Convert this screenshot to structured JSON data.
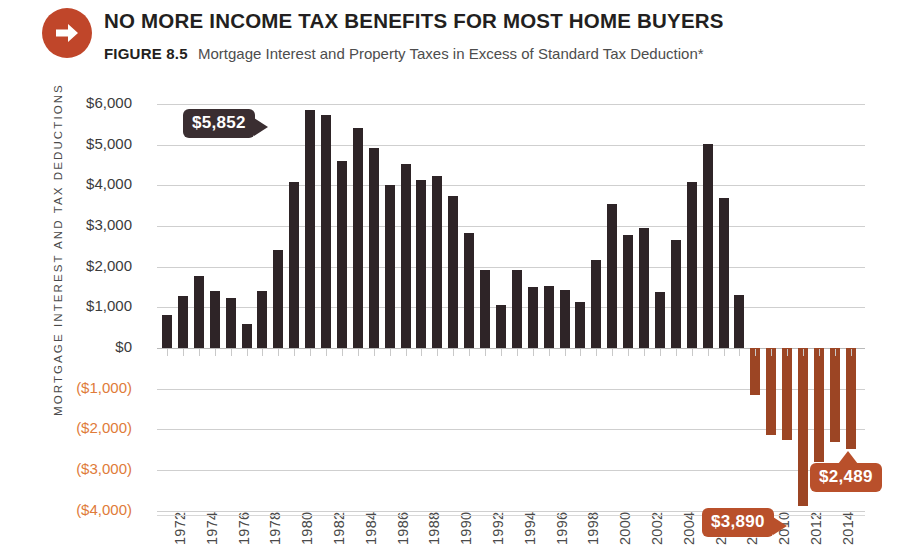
{
  "header": {
    "icon": "arrow-right-circle-icon",
    "title": "NO MORE INCOME TAX BENEFITS FOR MOST HOME BUYERS",
    "figure_number": "FIGURE 8.5",
    "subtitle": "Mortgage Interest and Property Taxes in Excess of Standard Tax Deduction*"
  },
  "colors": {
    "positive_bar": "#2e2427",
    "negative_bar": "#9c4524",
    "accent_orange": "#b9502b",
    "badge": "#c0462a",
    "negative_tick_label": "#e07b39",
    "gridline": "#cfcfcf"
  },
  "annotations": [
    {
      "label": "$5,852",
      "style": "dark",
      "tail": "right",
      "year": 1981
    },
    {
      "label": "$3,890",
      "style": "orange",
      "tail": "right",
      "year": 2012
    },
    {
      "label": "$2,489",
      "style": "orange",
      "tail": "up",
      "year": 2015
    }
  ],
  "chart_data": {
    "type": "bar",
    "title": "NO MORE INCOME TAX BENEFITS FOR MOST HOME BUYERS",
    "subtitle": "Mortgage Interest and Property Taxes in Excess of Standard Tax Deduction*",
    "xlabel": "",
    "ylabel": "MORTGAGE INTEREST AND TAX DEDUCTIONS",
    "ylim": [
      -4000,
      6000
    ],
    "ytick_values": [
      6000,
      5000,
      4000,
      3000,
      2000,
      1000,
      0,
      -1000,
      -2000,
      -3000,
      -4000
    ],
    "ytick_labels": [
      "$6,000",
      "$5,000",
      "$4,000",
      "$3,000",
      "$2,000",
      "$1,000",
      "$0",
      "($1,000)",
      "($2,000)",
      "($3,000)",
      "($4,000)"
    ],
    "grid": true,
    "legend": "none",
    "xtick_labels": [
      "1972",
      "1974",
      "1976",
      "1978",
      "1980",
      "1982",
      "1984",
      "1986",
      "1988",
      "1990",
      "1992",
      "1994",
      "1996",
      "1998",
      "2000",
      "2002",
      "2004",
      "2006",
      "2008",
      "2010",
      "2012",
      "2014"
    ],
    "categories": [
      1972,
      1973,
      1974,
      1975,
      1976,
      1977,
      1978,
      1979,
      1980,
      1981,
      1982,
      1983,
      1984,
      1985,
      1986,
      1987,
      1988,
      1989,
      1990,
      1991,
      1992,
      1993,
      1994,
      1995,
      1996,
      1997,
      1998,
      1999,
      2000,
      2001,
      2002,
      2003,
      2004,
      2005,
      2006,
      2007,
      2008,
      2009,
      2010,
      2011,
      2012,
      2013,
      2014,
      2015
    ],
    "values": [
      820,
      1270,
      1760,
      1390,
      1240,
      580,
      1410,
      2420,
      4080,
      5852,
      5740,
      4600,
      5400,
      4920,
      4020,
      4520,
      4120,
      4220,
      3740,
      2820,
      1930,
      1060,
      1930,
      1500,
      1520,
      1430,
      1130,
      2160,
      3540,
      2780,
      2940,
      1380,
      2660,
      4080,
      5010,
      3690,
      1300,
      -1150,
      -2150,
      -2250,
      -3890,
      -2800,
      -2300,
      -2489
    ],
    "series": [
      {
        "name": "Mortgage Interest and Property Taxes in Excess of Standard Tax Deduction",
        "values": [
          820,
          1270,
          1760,
          1390,
          1240,
          580,
          1410,
          2420,
          4080,
          5852,
          5740,
          4600,
          5400,
          4920,
          4020,
          4520,
          4120,
          4220,
          3740,
          2820,
          1930,
          1060,
          1930,
          1500,
          1520,
          1430,
          1130,
          2160,
          3540,
          2780,
          2940,
          1380,
          2660,
          4080,
          5010,
          3690,
          1300,
          -1150,
          -2150,
          -2250,
          -3890,
          -2800,
          -2300,
          -2489
        ]
      }
    ]
  }
}
